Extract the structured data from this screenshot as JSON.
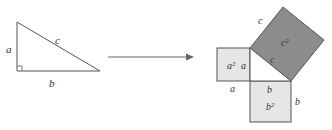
{
  "diagram": {
    "colors": {
      "line": "#555555",
      "small_square_fill": "#e6e6e6",
      "c_square_fill": "#8c8c8c",
      "background": "#ffffff"
    },
    "left_triangle": {
      "labels": {
        "a": "a",
        "b": "b",
        "c": "c"
      }
    },
    "arrow": {
      "direction": "right"
    },
    "right_figure": {
      "labels": {
        "c_outer": "c",
        "c_inner": "c",
        "c_square": "c²",
        "a_square": "a²",
        "a_inner": "a",
        "a_bottom": "a",
        "b_inner": "b",
        "b_square": "b²",
        "b_right": "b"
      }
    }
  }
}
